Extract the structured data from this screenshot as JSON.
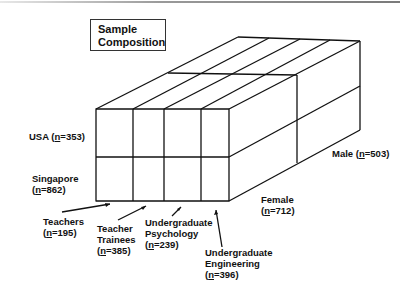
{
  "title": {
    "line1": "Sample",
    "line2": "Composition"
  },
  "rows": [
    {
      "name": "USA",
      "n": "353"
    },
    {
      "name": "Singapore",
      "n": "862"
    }
  ],
  "columns": [
    {
      "line1": "Teachers",
      "line2": "",
      "n": "195"
    },
    {
      "line1": "Teacher",
      "line2": "Trainees",
      "n": "385"
    },
    {
      "line1": "Undergraduate",
      "line2": "Psychology",
      "n": "239"
    },
    {
      "line1": "Undergraduate",
      "line2": "Engineering",
      "n": "396"
    }
  ],
  "depth": [
    {
      "name": "Female",
      "n": "712"
    },
    {
      "name": "Male",
      "n": "503"
    }
  ],
  "n_symbol": "n",
  "colors": {
    "line": "#111111",
    "text": "#111111",
    "background": "#ffffff"
  }
}
